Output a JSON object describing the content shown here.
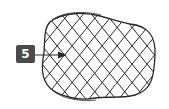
{
  "diagram": {
    "callout": {
      "number": "5",
      "box_color": "#4a4a4a",
      "text_color": "#ffffff"
    },
    "mesh": {
      "stroke_color": "#2a2a2a",
      "description": "diamond net mesh forming rounded tubular body"
    }
  }
}
